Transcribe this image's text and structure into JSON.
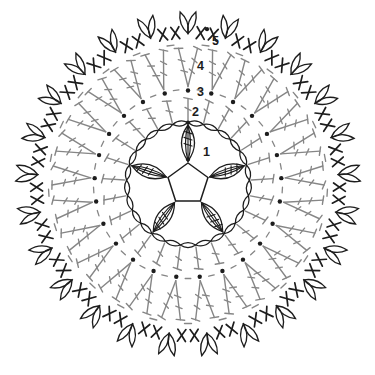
{
  "page": {
    "background": "#ffffff"
  },
  "diagram": {
    "canvas": {
      "width": 375,
      "height": 375,
      "center_x": 188,
      "center_y": 184
    },
    "colors": {
      "ink": "#1d1d1d",
      "gray": "#868686",
      "background": "#ffffff"
    },
    "center_pentagon": {
      "sides": 5,
      "circumradius": 21,
      "apex_angle_deg": 90
    },
    "petal_clusters": {
      "count": 5,
      "angles_deg": [
        90,
        162,
        234,
        306,
        18
      ],
      "base_radius": 23,
      "tip_radius": 59,
      "tick_count": 3
    },
    "chain_ring": {
      "chain_count": 25,
      "radius": 61.5
    },
    "round2_spokes": {
      "count": 25,
      "start_angle_deg": 90,
      "step_deg": 14.4,
      "base_radius": 63.5,
      "top_radius": 85.5,
      "tick_radius": 75
    },
    "round3_dots": {
      "count": 25,
      "radius": 93.5,
      "dot_size": 2.2,
      "dash_radius": 94.5
    },
    "round4_pairs": {
      "count": 25,
      "base_radius": 97.5,
      "top_radius": 136,
      "half_spread_deg": 4,
      "tick_fractions": [
        0.4,
        0.68
      ],
      "dash_radius": 139.5
    },
    "round5": {
      "cross_count": 50,
      "cross_radius": 151.5,
      "cross_half_len": 7.2,
      "cross_half_angle_deg": 34,
      "picot_count": 25,
      "picot_base_radius": 150.5,
      "leaf_length": 23,
      "leaf_half_angle_deg": 20
    },
    "start_dots": [
      {
        "radius": 24.5,
        "angle_deg": 90
      },
      {
        "radius": 61.5,
        "angle_deg": 90
      },
      {
        "radius": 156,
        "angle_deg": 83
      }
    ],
    "round_labels": [
      {
        "text": "1",
        "x": 203,
        "y": 156
      },
      {
        "text": "2",
        "x": 192,
        "y": 116
      },
      {
        "text": "3",
        "x": 197,
        "y": 96
      },
      {
        "text": "4",
        "x": 197,
        "y": 70
      },
      {
        "text": "5",
        "x": 212,
        "y": 45
      }
    ]
  }
}
